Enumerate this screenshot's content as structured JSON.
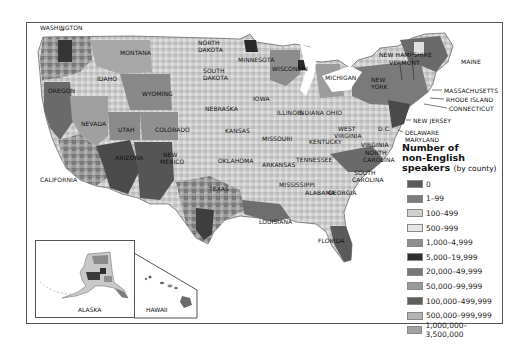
{
  "map": {
    "title": "Number of non-English speakers by county",
    "states": [
      {
        "name": "WASHINGTON",
        "x": 40,
        "y": 25
      },
      {
        "name": "MONTANA",
        "x": 120,
        "y": 50
      },
      {
        "name": "IDAHO",
        "x": 97,
        "y": 76
      },
      {
        "name": "OREGON",
        "x": 48,
        "y": 88
      },
      {
        "name": "WYOMING",
        "x": 142,
        "y": 91
      },
      {
        "name": "NORTH",
        "x": 198,
        "y": 40
      },
      {
        "name": "DAKOTA",
        "x": 198,
        "y": 47
      },
      {
        "name": "SOUTH",
        "x": 203,
        "y": 68
      },
      {
        "name": "DAKOTA",
        "x": 203,
        "y": 75
      },
      {
        "name": "MINNESOTA",
        "x": 238,
        "y": 57
      },
      {
        "name": "WISCONSIN",
        "x": 272,
        "y": 66
      },
      {
        "name": "MICHIGAN",
        "x": 325,
        "y": 75
      },
      {
        "name": "NEBRASKA",
        "x": 205,
        "y": 106
      },
      {
        "name": "IOWA",
        "x": 253,
        "y": 96
      },
      {
        "name": "NEVADA",
        "x": 81,
        "y": 121
      },
      {
        "name": "UTAH",
        "x": 118,
        "y": 127
      },
      {
        "name": "COLORADO",
        "x": 155,
        "y": 127
      },
      {
        "name": "KANSAS",
        "x": 225,
        "y": 128
      },
      {
        "name": "MISSOURI",
        "x": 262,
        "y": 136
      },
      {
        "name": "ILLINOIS",
        "x": 277,
        "y": 110
      },
      {
        "name": "INDIANA",
        "x": 298,
        "y": 110
      },
      {
        "name": "OHIO",
        "x": 326,
        "y": 110
      },
      {
        "name": "KENTUCKY",
        "x": 309,
        "y": 139
      },
      {
        "name": "WEST",
        "x": 338,
        "y": 126
      },
      {
        "name": "VIRGINIA",
        "x": 334,
        "y": 133
      },
      {
        "name": "VIRGINIA",
        "x": 361,
        "y": 142
      },
      {
        "name": "D.C.",
        "x": 378,
        "y": 126
      },
      {
        "name": "CALIFORNIA",
        "x": 40,
        "y": 177
      },
      {
        "name": "ARIZONA",
        "x": 115,
        "y": 155
      },
      {
        "name": "NEW",
        "x": 163,
        "y": 152
      },
      {
        "name": "MEXICO",
        "x": 160,
        "y": 159
      },
      {
        "name": "OKLAHOMA",
        "x": 218,
        "y": 158
      },
      {
        "name": "ARKANSAS",
        "x": 262,
        "y": 162
      },
      {
        "name": "TENNESSEE",
        "x": 296,
        "y": 157
      },
      {
        "name": "NORTH",
        "x": 365,
        "y": 150
      },
      {
        "name": "CAROLINA",
        "x": 363,
        "y": 157
      },
      {
        "name": "SOUTH",
        "x": 354,
        "y": 170
      },
      {
        "name": "CAROLINA",
        "x": 352,
        "y": 177
      },
      {
        "name": "TEXAS",
        "x": 209,
        "y": 186
      },
      {
        "name": "MISSISSIPPI",
        "x": 279,
        "y": 182
      },
      {
        "name": "ALABAMA",
        "x": 305,
        "y": 190
      },
      {
        "name": "GEORGIA",
        "x": 328,
        "y": 190
      },
      {
        "name": "LOUISIANA",
        "x": 259,
        "y": 219
      },
      {
        "name": "FLORIDA",
        "x": 318,
        "y": 238
      },
      {
        "name": "NEW HAMPSHIRE",
        "x": 379,
        "y": 52
      },
      {
        "name": "VERMONT",
        "x": 389,
        "y": 60
      },
      {
        "name": "MAINE",
        "x": 461,
        "y": 59
      },
      {
        "name": "NEW",
        "x": 371,
        "y": 77
      },
      {
        "name": "YORK",
        "x": 371,
        "y": 84
      },
      {
        "name": "MASSACHUSETTS",
        "x": 444,
        "y": 88
      },
      {
        "name": "RHODE ISLAND",
        "x": 446,
        "y": 97
      },
      {
        "name": "CONNECTICUT",
        "x": 449,
        "y": 106
      },
      {
        "name": "NEW JERSEY",
        "x": 413,
        "y": 118
      },
      {
        "name": "DELAWARE",
        "x": 405,
        "y": 130
      },
      {
        "name": "MARYLAND",
        "x": 405,
        "y": 137
      }
    ],
    "insets": {
      "alaska_label": "ALASKA",
      "hawaii_label": "HAWAII"
    }
  },
  "legend": {
    "title_line1": "Number of",
    "title_line2": "non-English",
    "title_line3": "speakers",
    "title_sub": "(by county)",
    "items": [
      {
        "label": "0",
        "color": "#5a5a5a"
      },
      {
        "label": "1–99",
        "color": "#7c7c7c"
      },
      {
        "label": "100–499",
        "color": "#d0d0d0"
      },
      {
        "label": "500–999",
        "color": "#e6e6e6"
      },
      {
        "label": "1,000–4,999",
        "color": "#8e8e8e"
      },
      {
        "label": "5,000–19,999",
        "color": "#2e2e2e"
      },
      {
        "label": "20,000–49,999",
        "color": "#787878"
      },
      {
        "label": "50,000–99,999",
        "color": "#9a9a9a"
      },
      {
        "label": "100,000–499,999",
        "color": "#5e5e5e"
      },
      {
        "label": "500,000–999,999",
        "color": "#b4b4b4"
      },
      {
        "label": "1,000,000–3,500,000",
        "color": "#a2a2a2"
      }
    ]
  }
}
